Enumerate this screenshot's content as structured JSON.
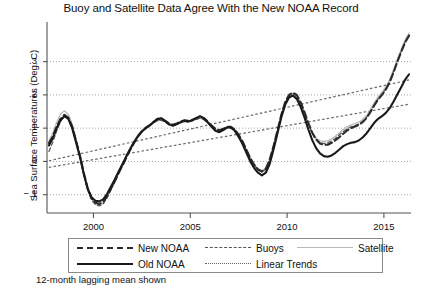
{
  "chart_data": {
    "type": "line",
    "title": "Buoy and Satellite Data Agree With the New NOAA Record",
    "xlabel": "",
    "ylabel": "Sea Surface Temperatures (Deg. C)",
    "xlim": [
      1997.6,
      2016.4
    ],
    "ylim": [
      -0.155,
      0.395
    ],
    "xticks": [
      2000,
      2005,
      2010,
      2015
    ],
    "xtick_labels": [
      "2000",
      "2005",
      "2010",
      "2015"
    ],
    "yticks": [
      -0.1,
      0,
      0.1,
      0.2,
      0.3
    ],
    "ytick_labels": [
      "−.1",
      "0",
      ".1",
      ".2",
      ".3"
    ],
    "grid": true,
    "grid_style": "dotted-horizontal",
    "annotation": "12-month lagging mean shown",
    "legend_position": "below-axes",
    "legend": [
      {
        "name": "New NOAA",
        "style": "dashed-thick",
        "color": "#2b2b2b"
      },
      {
        "name": "Old NOAA",
        "style": "solid-thick",
        "color": "#1a1a1a"
      },
      {
        "name": "Buoys",
        "style": "dashed-thin",
        "color": "#555555"
      },
      {
        "name": "Linear Trends",
        "style": "dotted-thin",
        "color": "#666666"
      },
      {
        "name": "Satellite",
        "style": "solid-thin",
        "color": "#b9b9b9"
      }
    ],
    "x": [
      1997.7,
      1997.9,
      1998.1,
      1998.3,
      1998.5,
      1998.7,
      1998.9,
      1999.1,
      1999.3,
      1999.5,
      1999.7,
      1999.9,
      2000.1,
      2000.3,
      2000.5,
      2000.7,
      2000.9,
      2001.1,
      2001.3,
      2001.5,
      2001.7,
      2001.9,
      2002.1,
      2002.3,
      2002.5,
      2002.7,
      2002.9,
      2003.1,
      2003.3,
      2003.5,
      2003.7,
      2003.9,
      2004.1,
      2004.3,
      2004.5,
      2004.7,
      2004.9,
      2005.1,
      2005.3,
      2005.5,
      2005.7,
      2005.9,
      2006.1,
      2006.3,
      2006.5,
      2006.7,
      2006.9,
      2007.1,
      2007.3,
      2007.5,
      2007.7,
      2007.9,
      2008.1,
      2008.3,
      2008.5,
      2008.7,
      2008.9,
      2009.1,
      2009.3,
      2009.5,
      2009.7,
      2009.9,
      2010.1,
      2010.3,
      2010.5,
      2010.7,
      2010.9,
      2011.1,
      2011.3,
      2011.5,
      2011.7,
      2011.9,
      2012.1,
      2012.3,
      2012.5,
      2012.7,
      2012.9,
      2013.1,
      2013.3,
      2013.5,
      2013.7,
      2013.9,
      2014.1,
      2014.3,
      2014.5,
      2014.7,
      2014.9,
      2015.1,
      2015.3,
      2015.5,
      2015.7,
      2015.9,
      2016.1,
      2016.3
    ],
    "series": [
      {
        "name": "New NOAA",
        "style": "dashed-thick",
        "color": "#2b2b2b",
        "values": [
          0.055,
          0.075,
          0.105,
          0.128,
          0.14,
          0.132,
          0.105,
          0.062,
          0.018,
          -0.035,
          -0.08,
          -0.11,
          -0.124,
          -0.128,
          -0.122,
          -0.105,
          -0.082,
          -0.06,
          -0.035,
          -0.012,
          0.012,
          0.035,
          0.056,
          0.075,
          0.09,
          0.1,
          0.108,
          0.118,
          0.126,
          0.128,
          0.122,
          0.114,
          0.11,
          0.114,
          0.12,
          0.124,
          0.122,
          0.125,
          0.13,
          0.134,
          0.13,
          0.12,
          0.108,
          0.098,
          0.094,
          0.098,
          0.104,
          0.104,
          0.096,
          0.08,
          0.06,
          0.035,
          0.01,
          -0.01,
          -0.024,
          -0.03,
          -0.022,
          0.005,
          0.046,
          0.092,
          0.14,
          0.178,
          0.2,
          0.207,
          0.2,
          0.178,
          0.148,
          0.115,
          0.086,
          0.066,
          0.054,
          0.05,
          0.05,
          0.056,
          0.064,
          0.073,
          0.083,
          0.093,
          0.1,
          0.105,
          0.11,
          0.118,
          0.13,
          0.148,
          0.168,
          0.186,
          0.2,
          0.216,
          0.238,
          0.268,
          0.3,
          0.33,
          0.358,
          0.378
        ]
      },
      {
        "name": "Old NOAA",
        "style": "solid-thick",
        "color": "#1a1a1a",
        "values": [
          0.048,
          0.07,
          0.1,
          0.124,
          0.136,
          0.128,
          0.1,
          0.058,
          0.014,
          -0.038,
          -0.082,
          -0.108,
          -0.118,
          -0.12,
          -0.114,
          -0.098,
          -0.076,
          -0.054,
          -0.03,
          -0.008,
          0.016,
          0.038,
          0.058,
          0.076,
          0.09,
          0.1,
          0.108,
          0.118,
          0.128,
          0.13,
          0.122,
          0.112,
          0.108,
          0.112,
          0.118,
          0.122,
          0.12,
          0.124,
          0.13,
          0.136,
          0.13,
          0.118,
          0.104,
          0.092,
          0.088,
          0.094,
          0.102,
          0.102,
          0.092,
          0.074,
          0.052,
          0.026,
          0.0,
          -0.02,
          -0.034,
          -0.042,
          -0.034,
          -0.008,
          0.036,
          0.084,
          0.132,
          0.17,
          0.192,
          0.198,
          0.188,
          0.164,
          0.132,
          0.096,
          0.064,
          0.04,
          0.024,
          0.016,
          0.014,
          0.018,
          0.026,
          0.036,
          0.046,
          0.052,
          0.056,
          0.058,
          0.063,
          0.072,
          0.084,
          0.1,
          0.116,
          0.128,
          0.136,
          0.146,
          0.16,
          0.18,
          0.202,
          0.224,
          0.246,
          0.262
        ]
      },
      {
        "name": "Buoys",
        "style": "dashed-thin",
        "color": "#555555",
        "values": [
          0.03,
          0.058,
          0.092,
          0.12,
          0.136,
          0.13,
          0.104,
          0.06,
          0.014,
          -0.04,
          -0.086,
          -0.116,
          -0.13,
          -0.134,
          -0.128,
          -0.11,
          -0.086,
          -0.062,
          -0.036,
          -0.012,
          0.012,
          0.036,
          0.058,
          0.076,
          0.09,
          0.1,
          0.108,
          0.116,
          0.122,
          0.124,
          0.118,
          0.11,
          0.106,
          0.11,
          0.116,
          0.12,
          0.118,
          0.122,
          0.126,
          0.13,
          0.126,
          0.116,
          0.104,
          0.094,
          0.09,
          0.094,
          0.1,
          0.1,
          0.092,
          0.076,
          0.056,
          0.032,
          0.008,
          -0.012,
          -0.026,
          -0.032,
          -0.024,
          0.004,
          0.044,
          0.09,
          0.138,
          0.176,
          0.198,
          0.204,
          0.196,
          0.174,
          0.144,
          0.112,
          0.084,
          0.066,
          0.056,
          0.054,
          0.056,
          0.062,
          0.07,
          0.08,
          0.09,
          0.098,
          0.104,
          0.108,
          0.112,
          0.12,
          0.132,
          0.15,
          0.17,
          0.188,
          0.202,
          0.218,
          0.24,
          0.27,
          0.302,
          0.332,
          0.36,
          0.38
        ]
      },
      {
        "name": "Satellite",
        "style": "solid-thin",
        "color": "#b9b9b9",
        "values": [
          0.062,
          0.086,
          0.118,
          0.142,
          0.152,
          0.142,
          0.112,
          0.066,
          0.018,
          -0.036,
          -0.082,
          -0.112,
          -0.126,
          -0.13,
          -0.124,
          -0.106,
          -0.082,
          -0.058,
          -0.032,
          -0.008,
          0.016,
          0.04,
          0.062,
          0.08,
          0.094,
          0.104,
          0.11,
          0.118,
          0.124,
          0.126,
          0.12,
          0.112,
          0.108,
          0.112,
          0.118,
          0.122,
          0.12,
          0.122,
          0.126,
          0.13,
          0.126,
          0.116,
          0.106,
          0.098,
          0.094,
          0.098,
          0.104,
          0.104,
          0.096,
          0.08,
          0.06,
          0.036,
          0.012,
          -0.008,
          -0.022,
          -0.028,
          -0.02,
          0.006,
          0.046,
          0.092,
          0.138,
          0.174,
          0.194,
          0.2,
          0.192,
          0.172,
          0.144,
          0.112,
          0.086,
          0.07,
          0.062,
          0.06,
          0.062,
          0.068,
          0.076,
          0.086,
          0.096,
          0.104,
          0.11,
          0.114,
          0.118,
          0.126,
          0.138,
          0.156,
          0.176,
          0.194,
          0.208,
          0.224,
          0.246,
          0.276,
          0.308,
          0.338,
          0.366,
          0.386
        ]
      }
    ],
    "trend_lines": [
      {
        "name": "Linear Trend New NOAA",
        "x": [
          1997.7,
          2016.3
        ],
        "y": [
          0.002,
          0.245
        ],
        "style": "dotted-thin",
        "color": "#666666"
      },
      {
        "name": "Linear Trend Old NOAA",
        "x": [
          1997.7,
          2016.3
        ],
        "y": [
          -0.018,
          0.172
        ],
        "style": "dotted-thin",
        "color": "#666666"
      }
    ]
  },
  "footnote": {
    "text": "12-month lagging mean shown"
  }
}
